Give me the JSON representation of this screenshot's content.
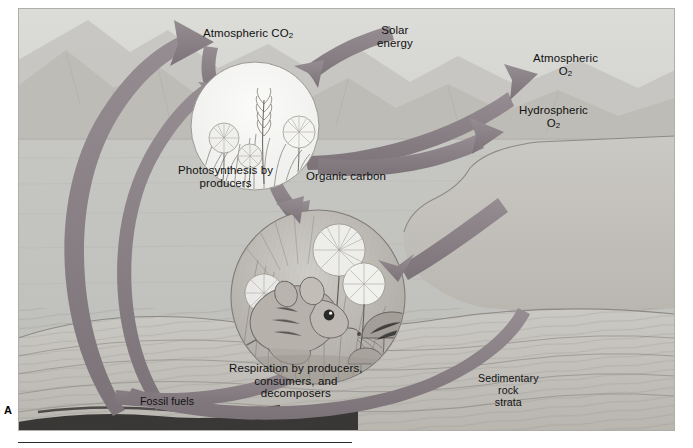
{
  "figure": {
    "panel_letter": "A",
    "caption_rule": true
  },
  "labels": {
    "atmospheric_co2": "Atmospheric CO",
    "atmospheric_co2_sub": "2",
    "solar_energy": "Solar\nenergy",
    "atmospheric_o2": "Atmospheric",
    "atmospheric_o2_sub": "2",
    "atmospheric_o2_symbol": "O",
    "hydrospheric_o2": "Hydrospheric",
    "hydrospheric_o2_symbol": "O",
    "hydrospheric_o2_sub": "2",
    "photosynthesis": "Photosynthesis by\nproducers",
    "organic_carbon": "Organic carbon",
    "respiration": "Respiration by producers,\nconsumers, and\ndecomposers",
    "fossil_fuels": "Fossil fuels",
    "sedimentary_rock": "Sedimentary\nrock\nstrata"
  },
  "scene": {
    "photosynthesis_circle": {
      "name": "photosynthesis-inset",
      "cx": 237,
      "cy": 118,
      "r": 64,
      "contents": [
        "grass",
        "dandelion-seedhead",
        "dandelion-flower",
        "wheat-stalk"
      ]
    },
    "respiration_circle": {
      "name": "respiration-inset",
      "cx": 300,
      "cy": 289,
      "r": 87,
      "contents": [
        "mouse",
        "dandelion-seedhead",
        "mushroom",
        "grass"
      ]
    },
    "landscape": [
      "sky",
      "mountains",
      "water",
      "shoreline",
      "rock-strata",
      "coal-seam"
    ]
  },
  "arrows": [
    {
      "name": "arrow-to-atmospheric-co2",
      "from": "fossil-fuels / deep strata",
      "to": "Atmospheric CO2",
      "direction": "up-right"
    },
    {
      "name": "arrow-solar-energy-to-photosynthesis",
      "from": "Solar energy",
      "to": "photosynthesis-inset",
      "direction": "down-left"
    },
    {
      "name": "arrow-co2-into-photosynthesis",
      "from": "Atmospheric CO2",
      "to": "photosynthesis-inset",
      "direction": "down"
    },
    {
      "name": "arrow-organic-carbon-to-respiration",
      "from": "photosynthesis-inset",
      "to": "respiration-inset",
      "direction": "down-right"
    },
    {
      "name": "arrow-o2-release",
      "from": "photosynthesis-inset",
      "to": "Atmospheric O2",
      "direction": "up-right"
    },
    {
      "name": "arrow-o2-hydrospheric",
      "from": "photosynthesis-inset",
      "to": "Hydrospheric O2",
      "direction": "right"
    },
    {
      "name": "arrow-o2-into-respiration",
      "from": "Hydrospheric O2",
      "to": "respiration-inset",
      "direction": "left"
    },
    {
      "name": "arrow-respiration-to-strata",
      "from": "respiration-inset",
      "to": "sedimentary rock strata",
      "direction": "down-left"
    },
    {
      "name": "arrow-strata-to-atmosphere",
      "from": "sedimentary rock strata",
      "to": "atmosphere",
      "direction": "up-left"
    }
  ],
  "colors": {
    "arrow": "#8a8186",
    "arrow_dark": "#6f676c",
    "sky": "#d6d6d3",
    "water": "#c2c2bf",
    "land": "#c8c6c1",
    "inset_fill": "#f2f2ef",
    "text": "#111111",
    "rule": "#2b2b2b"
  }
}
